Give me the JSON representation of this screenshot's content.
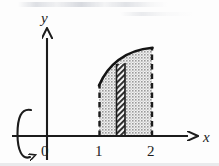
{
  "figure": {
    "title_present": false,
    "background_color": "#fdfdfd",
    "ink_color": "#1c1c1c",
    "shade_fill_color": "#b8b8b8",
    "hatch_color": "#303030"
  },
  "axes": {
    "x_axis": {
      "name": "x-axis",
      "label": "x",
      "label_x": 207,
      "label_y": 141,
      "y_pixel": 136,
      "start_x": 12,
      "end_x": 198,
      "arrow": true
    },
    "y_axis": {
      "name": "y-axis",
      "label": "y",
      "label_x": 45,
      "label_y": 22,
      "x_pixel": 47,
      "start_y": 160,
      "end_y": 28,
      "arrow": true
    }
  },
  "ticks": [
    {
      "label": "0",
      "x_pixel": 46,
      "y_pixel": 151,
      "on_axis": false
    },
    {
      "label": "1",
      "x_pixel": 99,
      "y_pixel": 151,
      "on_axis": true
    },
    {
      "label": "2",
      "x_pixel": 152,
      "y_pixel": 151,
      "on_axis": true
    }
  ],
  "region": {
    "name": "shaded-region",
    "x_from": 1,
    "x_to": 2,
    "left_pixel": 99,
    "right_pixel": 152,
    "baseline_pixel": 136,
    "curve_left_top_pixel": 85,
    "curve_right_top_pixel": 48,
    "fill": "stippled-gray",
    "boundary_left": "dashed",
    "boundary_right": "dashed",
    "boundary_top": "solid-curve"
  },
  "strip": {
    "name": "representative-strip",
    "left_pixel": 116,
    "right_pixel": 125,
    "top_pixel": 64,
    "bottom_pixel": 136,
    "fill": "diagonal-hatch"
  },
  "rotation_symbol": {
    "name": "rotation-about-y-axis-symbol",
    "center_x": 26,
    "center_y": 134,
    "radius_x": 8,
    "radius_y": 27,
    "description": "open elliptical loop with arrowhead indicating revolution about the vertical axis"
  },
  "curve": {
    "name": "function-curve",
    "points": [
      {
        "x": 1.0,
        "y_pixel": 85
      },
      {
        "x": 1.12,
        "y_pixel": 74
      },
      {
        "x": 1.25,
        "y_pixel": 66
      },
      {
        "x": 1.4,
        "y_pixel": 59
      },
      {
        "x": 1.55,
        "y_pixel": 54
      },
      {
        "x": 1.7,
        "y_pixel": 51
      },
      {
        "x": 1.85,
        "y_pixel": 49
      },
      {
        "x": 2.0,
        "y_pixel": 48
      }
    ]
  }
}
